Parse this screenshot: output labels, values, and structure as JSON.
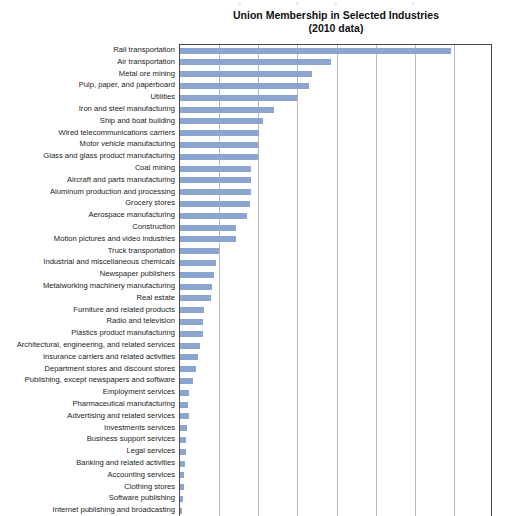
{
  "chart_data": {
    "type": "bar",
    "orientation": "horizontal",
    "title": "Union Membership in Selected Industries",
    "subtitle": "(2010 data)",
    "xlabel": "",
    "ylabel": "",
    "xlim": [
      0,
      40
    ],
    "xtick_interval": 5,
    "xticks_visible": false,
    "grid": true,
    "gridlines_vertical": 8,
    "legend": "none",
    "bar_color": "#8ba5d0",
    "axis_color": "#4a4a4a",
    "gridline_color": "#b9b9b9",
    "note": "Chart is cropped at the bottom; x-axis tick labels are not visible in the screenshot.",
    "categories": [
      "Rail transportation",
      "Air transportation",
      "Metal ore mining",
      "Pulp, paper, and paperboard",
      "Utilities",
      "Iron and steel manufacturing",
      "Ship and boat building",
      "Wired telecommunications carriers",
      "Motor vehicle manufacturing",
      "Glass and glass product manufacturing",
      "Coal mining",
      "Aircraft and parts manufacturing",
      "Aluminum production and processing",
      "Grocery stores",
      "Aerospace manufacturing",
      "Construction",
      "Motion pictures and video industries",
      "Truck transportation",
      "Industrial and miscellaneous chemicals",
      "Newspaper publishers",
      "Metalworking machinery manufacturing",
      "Real estate",
      "Furniture and related products",
      "Radio and television",
      "Plastics product manufacturing",
      "Architectural, engineering, and related services",
      "Insurance carriers and related activities",
      "Department stores and discount stores",
      "Publishing, except newspapers and software",
      "Employment services",
      "Pharmaceutical manufacturing",
      "Advertising and related services",
      "Investments services",
      "Business support services",
      "Legal services",
      "Banking and related activities",
      "Accounting services",
      "Clothing stores",
      "Software publishing",
      "Internet publishing and broadcasting"
    ],
    "values": [
      34.6,
      19.3,
      16.9,
      16.5,
      14.9,
      12.0,
      10.6,
      10.1,
      10.0,
      10.0,
      9.1,
      9.1,
      9.1,
      9.0,
      8.6,
      7.2,
      7.1,
      5.0,
      4.6,
      4.3,
      4.1,
      4.0,
      3.1,
      2.9,
      2.9,
      2.6,
      2.3,
      2.0,
      1.7,
      1.1,
      1.0,
      1.1,
      0.9,
      0.8,
      0.7,
      0.6,
      0.5,
      0.5,
      0.4,
      0.3
    ]
  }
}
